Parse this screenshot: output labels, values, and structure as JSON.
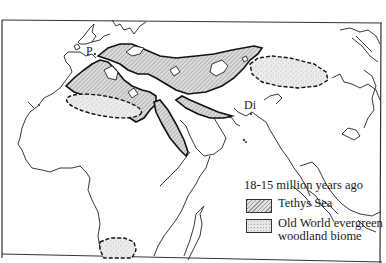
{
  "map": {
    "type": "paleogeographic map",
    "region": "Old World (Europe, Africa, Middle East, Asia)",
    "labels": [
      {
        "id": "P",
        "text": "P"
      },
      {
        "id": "Di",
        "text": "Di"
      }
    ]
  },
  "legend": {
    "title": "18-15 million years ago",
    "items": [
      {
        "pattern": "diagonal-hatch",
        "label": "Tethys Sea"
      },
      {
        "pattern": "stipple",
        "label_line1": "Old World evergreen",
        "label_line2": "woodland biome"
      }
    ]
  },
  "colors": {
    "line": "#1a1a1a",
    "hatch_fill": "#cfcfcf",
    "stipple_fill": "#e6e6e6",
    "background": "#ffffff"
  }
}
